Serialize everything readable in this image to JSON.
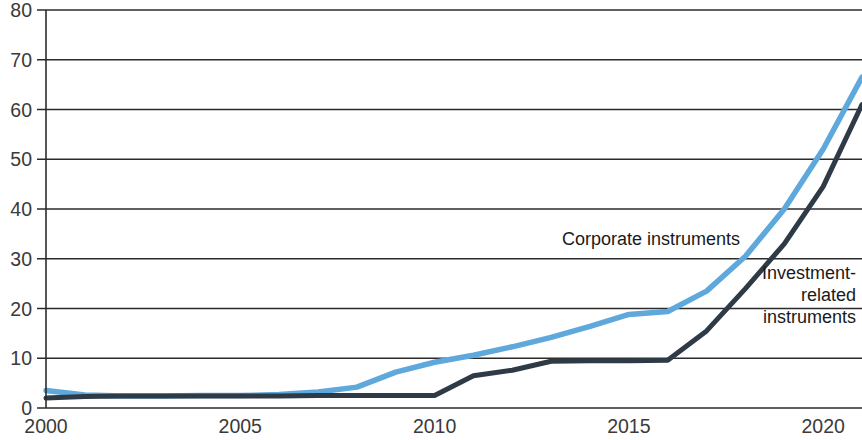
{
  "chart_data": {
    "type": "line",
    "title": "",
    "subtitle": "",
    "xlabel": "",
    "ylabel": "",
    "xlim": [
      2000,
      2021
    ],
    "ylim": [
      0,
      80
    ],
    "grid": true,
    "legend_position": "inline-annotation",
    "x_ticks": [
      "2000",
      "2005",
      "2010",
      "2015",
      "2020"
    ],
    "x_tick_values": [
      2000,
      2005,
      2010,
      2015,
      2020
    ],
    "y_ticks": [
      "0",
      "10",
      "20",
      "30",
      "40",
      "50",
      "60",
      "70",
      "80"
    ],
    "y_tick_values": [
      0,
      10,
      20,
      30,
      40,
      50,
      60,
      70,
      80
    ],
    "x": [
      2000,
      2001,
      2002,
      2003,
      2004,
      2005,
      2006,
      2007,
      2008,
      2009,
      2010,
      2011,
      2012,
      2013,
      2014,
      2015,
      2016,
      2017,
      2018,
      2019,
      2020,
      2021
    ],
    "series": [
      {
        "name": "Corporate instruments",
        "color": "#5FA8DC",
        "annotation_label": "Corporate instruments",
        "values": [
          3.5,
          2.6,
          2.4,
          2.4,
          2.5,
          2.5,
          2.7,
          3.2,
          4.2,
          7.2,
          9.2,
          10.6,
          12.3,
          14.2,
          16.4,
          18.8,
          19.4,
          23.5,
          30.5,
          40.0,
          52.0,
          66.5
        ]
      },
      {
        "name": "Investment-related instruments",
        "color": "#2E3A45",
        "annotation_label": "Investment-related instruments",
        "annotation_lines": [
          "Investment-",
          "related",
          "instruments"
        ],
        "values": [
          2.0,
          2.3,
          2.4,
          2.4,
          2.4,
          2.4,
          2.4,
          2.5,
          2.5,
          2.5,
          2.5,
          6.5,
          7.6,
          9.4,
          9.5,
          9.5,
          9.6,
          15.5,
          24.0,
          33.0,
          44.5,
          61.0
        ]
      }
    ]
  },
  "annotations": {
    "corporate": "Corporate instruments",
    "investment_line1": "Investment-",
    "investment_line2": "related",
    "investment_line3": "instruments"
  },
  "colors": {
    "corporate": "#5FA8DC",
    "investment": "#2E3A45",
    "axis": "#2b2b2b",
    "label": "#3a3a3a",
    "background": "#ffffff"
  }
}
